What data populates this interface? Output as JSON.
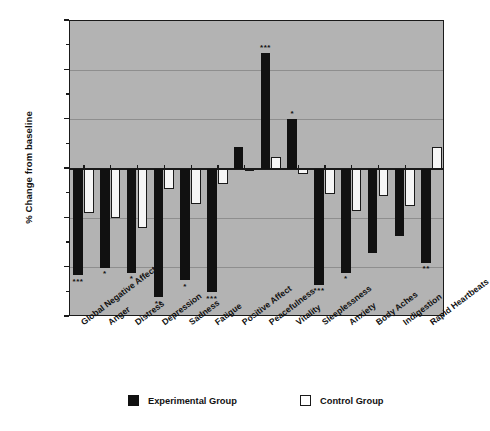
{
  "chart_data": {
    "type": "bar",
    "title": "",
    "xlabel": "",
    "ylabel": "% Change from baseline",
    "ylim": [
      -30,
      30
    ],
    "yticks": [
      "30%",
      "20%",
      "10%",
      "0%",
      "-10%",
      "-20%",
      "-30%"
    ],
    "ytick_values": [
      30,
      20,
      10,
      0,
      -10,
      -20,
      -30
    ],
    "grid": true,
    "legend_position": "bottom",
    "categories": [
      "Global Negative Affect",
      "Anger",
      "Distress",
      "Depression",
      "Sadness",
      "Fatigue",
      "Positive Affect",
      "Peacefulness",
      "Vitality",
      "Sleeplessness",
      "Anxiety",
      "Body Aches",
      "Indigestion",
      "Rapid Heartbeats"
    ],
    "series": [
      {
        "name": "Experimental Group",
        "color": "#111111",
        "values": [
          -21.5,
          -20.0,
          -21.0,
          -26.0,
          -22.5,
          -25.0,
          4.5,
          23.5,
          10.2,
          -23.5,
          -21.0,
          -17.0,
          -13.5,
          -19.0
        ],
        "significance": [
          "***",
          "*",
          "*",
          "**",
          "*",
          "***",
          "",
          "***",
          "*",
          "***",
          "*",
          "",
          "",
          "**"
        ]
      },
      {
        "name": "Control Group",
        "color": "#f6f6f6",
        "values": [
          -9.0,
          -10.0,
          -12.0,
          -4.0,
          -7.0,
          -3.0,
          0.0,
          2.5,
          -1.0,
          -5.0,
          -8.5,
          -5.5,
          -7.5,
          4.5
        ],
        "significance": [
          "",
          "",
          "",
          "",
          "",
          "",
          "",
          "",
          "",
          "",
          "",
          "",
          "",
          ""
        ]
      }
    ]
  },
  "legend": {
    "experimental_label": "Experimental Group",
    "control_label": "Control Group"
  }
}
